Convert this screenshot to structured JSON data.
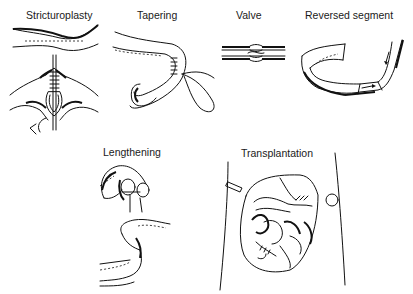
{
  "figure": {
    "panels": [
      {
        "id": "stricturoplasty",
        "label": "Stricturoplasty"
      },
      {
        "id": "tapering",
        "label": "Tapering"
      },
      {
        "id": "valve",
        "label": "Valve"
      },
      {
        "id": "reversed-segment",
        "label": "Reversed segment"
      },
      {
        "id": "lengthening",
        "label": "Lengthening"
      },
      {
        "id": "transplantation",
        "label": "Transplantation"
      }
    ]
  }
}
